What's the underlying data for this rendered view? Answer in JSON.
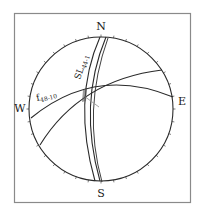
{
  "diagram": {
    "type": "stereonet",
    "frame": {
      "x": 14,
      "y": 13,
      "width": 177,
      "height": 190,
      "stroke": "#8a8a8a"
    },
    "net": {
      "cx": 101,
      "cy": 109,
      "r": 72,
      "stroke": "#2a2a2a"
    },
    "directions": {
      "north": "N",
      "south": "S",
      "east": "E",
      "west": "W"
    },
    "labels": {
      "sl": {
        "main": "SL",
        "sub": "44-1"
      },
      "f": {
        "main": "f",
        "sub": "48-10"
      }
    },
    "colors": {
      "line": "#2a2a2a",
      "pole_line": "#9a9a9a",
      "background": "#ffffff"
    }
  }
}
